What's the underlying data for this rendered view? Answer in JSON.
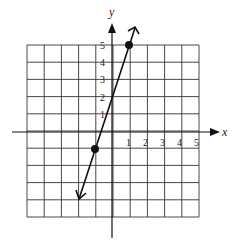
{
  "chart_data": {
    "type": "line",
    "title": "",
    "xlabel": "x",
    "ylabel": "y",
    "xlim": [
      -5,
      5
    ],
    "ylim": [
      -5,
      5
    ],
    "grid": true,
    "x_tick_labels": [
      "1",
      "2",
      "3",
      "4",
      "5"
    ],
    "y_tick_labels": [
      "1",
      "2",
      "3",
      "4",
      "5"
    ],
    "points": [
      {
        "x": -1,
        "y": -1
      },
      {
        "x": 1,
        "y": 5
      }
    ],
    "line": {
      "slope": 3,
      "intercept": 2,
      "equation": "y = 3x + 2",
      "arrows_both_ends": true
    }
  },
  "labels": {
    "x_axis": "x",
    "y_axis": "y",
    "x_ticks": [
      "1",
      "2",
      "3",
      "4",
      "5"
    ],
    "y_ticks": [
      "1",
      "2",
      "3",
      "4",
      "5"
    ]
  }
}
